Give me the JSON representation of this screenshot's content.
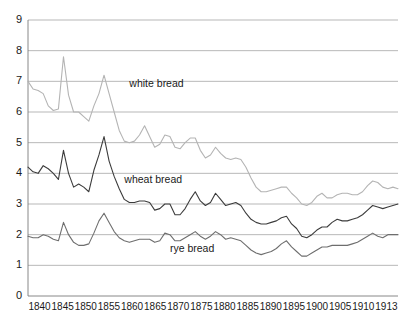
{
  "chart_data": {
    "type": "line",
    "title": "",
    "subtitle": "",
    "xlabel": "",
    "ylabel": "",
    "xlim": [
      1840,
      1913
    ],
    "ylim": [
      0,
      9
    ],
    "grid": true,
    "legend_position": "inline-annotations",
    "y_ticks": [
      "0",
      "1",
      "2",
      "3",
      "4",
      "5",
      "6",
      "7",
      "8",
      "9"
    ],
    "x_ticks": [
      "1840",
      "1845",
      "1850",
      "1855",
      "1860",
      "1865",
      "1870",
      "1875",
      "1880",
      "1885",
      "1890",
      "1895",
      "1900",
      "1905",
      "1910",
      "1913"
    ],
    "annotations": [
      {
        "text": "white bread",
        "x": 1860,
        "y": 6.8
      },
      {
        "text": "wheat bread",
        "x": 1859,
        "y": 3.7
      },
      {
        "text": "rye bread",
        "x": 1868,
        "y": 1.45
      }
    ],
    "x": [
      1840,
      1841,
      1842,
      1843,
      1844,
      1845,
      1846,
      1847,
      1848,
      1849,
      1850,
      1851,
      1852,
      1853,
      1854,
      1855,
      1856,
      1857,
      1858,
      1859,
      1860,
      1861,
      1862,
      1863,
      1864,
      1865,
      1866,
      1867,
      1868,
      1869,
      1870,
      1871,
      1872,
      1873,
      1874,
      1875,
      1876,
      1877,
      1878,
      1879,
      1880,
      1881,
      1882,
      1883,
      1884,
      1885,
      1886,
      1887,
      1888,
      1889,
      1890,
      1891,
      1892,
      1893,
      1894,
      1895,
      1896,
      1897,
      1898,
      1899,
      1900,
      1901,
      1902,
      1903,
      1904,
      1905,
      1906,
      1907,
      1908,
      1909,
      1910,
      1911,
      1912,
      1913
    ],
    "series": [
      {
        "name": "white bread",
        "color": "#b4b4b4",
        "values": [
          7.0,
          6.75,
          6.7,
          6.6,
          6.2,
          6.05,
          6.1,
          7.8,
          6.55,
          6.0,
          6.0,
          5.85,
          5.7,
          6.2,
          6.6,
          7.2,
          6.6,
          6.0,
          5.4,
          5.05,
          5.0,
          5.05,
          5.25,
          5.55,
          5.2,
          4.85,
          4.95,
          5.25,
          5.2,
          4.85,
          4.8,
          5.0,
          5.15,
          5.15,
          4.75,
          4.5,
          4.6,
          4.85,
          4.65,
          4.5,
          4.45,
          4.5,
          4.45,
          4.2,
          3.85,
          3.55,
          3.4,
          3.4,
          3.45,
          3.5,
          3.55,
          3.55,
          3.35,
          3.2,
          3.0,
          2.95,
          3.05,
          3.25,
          3.35,
          3.2,
          3.2,
          3.3,
          3.35,
          3.35,
          3.3,
          3.3,
          3.4,
          3.6,
          3.75,
          3.7,
          3.55,
          3.5,
          3.55,
          3.5
        ]
      },
      {
        "name": "wheat bread",
        "color": "#3c3c3c",
        "values": [
          4.2,
          4.05,
          4.0,
          4.25,
          4.15,
          4.0,
          3.8,
          4.75,
          4.0,
          3.55,
          3.65,
          3.55,
          3.4,
          4.1,
          4.6,
          5.2,
          4.4,
          3.9,
          3.5,
          3.15,
          3.05,
          3.05,
          3.1,
          3.1,
          3.05,
          2.8,
          2.85,
          3.0,
          3.0,
          2.65,
          2.65,
          2.85,
          3.15,
          3.4,
          3.1,
          2.95,
          3.05,
          3.35,
          3.15,
          2.95,
          3.0,
          3.05,
          2.95,
          2.7,
          2.5,
          2.4,
          2.35,
          2.35,
          2.4,
          2.45,
          2.55,
          2.6,
          2.35,
          2.2,
          1.95,
          1.9,
          2.0,
          2.15,
          2.25,
          2.25,
          2.4,
          2.5,
          2.45,
          2.45,
          2.5,
          2.55,
          2.65,
          2.8,
          2.95,
          2.9,
          2.85,
          2.9,
          2.95,
          3.0
        ]
      },
      {
        "name": "rye bread",
        "color": "#6e6e6e",
        "values": [
          1.95,
          1.9,
          1.9,
          2.0,
          1.95,
          1.85,
          1.8,
          2.4,
          2.0,
          1.75,
          1.65,
          1.65,
          1.7,
          2.05,
          2.45,
          2.7,
          2.4,
          2.1,
          1.9,
          1.8,
          1.75,
          1.8,
          1.85,
          1.85,
          1.85,
          1.75,
          1.8,
          2.05,
          2.0,
          1.8,
          1.8,
          1.9,
          2.0,
          2.1,
          1.95,
          1.85,
          1.95,
          2.1,
          2.0,
          1.85,
          1.9,
          1.85,
          1.8,
          1.65,
          1.5,
          1.4,
          1.35,
          1.4,
          1.45,
          1.55,
          1.7,
          1.8,
          1.6,
          1.45,
          1.3,
          1.3,
          1.4,
          1.5,
          1.6,
          1.6,
          1.65,
          1.65,
          1.65,
          1.65,
          1.7,
          1.75,
          1.85,
          1.95,
          2.05,
          1.95,
          1.9,
          2.0,
          2.0,
          2.0
        ]
      }
    ]
  }
}
